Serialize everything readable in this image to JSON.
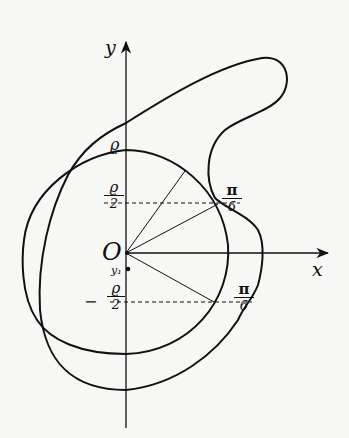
{
  "diagram": {
    "axes": {
      "x_label": "x",
      "y_label": "y",
      "origin_label": "O"
    },
    "labels": {
      "rho_top": "ϱ",
      "rho_half_upper": {
        "num": "ϱ",
        "den": "2"
      },
      "rho_half_lower": {
        "sign": "−",
        "num": "ϱ",
        "den": "2"
      },
      "pi_sixth_upper": {
        "num": "π",
        "den": "6"
      },
      "pi_sixth_lower": {
        "num": "π",
        "den": "6"
      },
      "y1": "y₁"
    },
    "colors": {
      "stroke": "#111111",
      "background": "#f7f7f5"
    }
  }
}
